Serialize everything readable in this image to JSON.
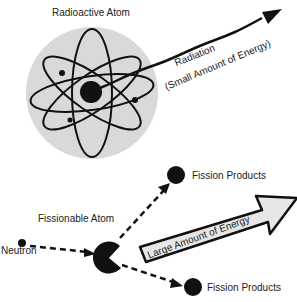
{
  "diagram": {
    "labels": {
      "radioactive_atom": "Radioactive Atom",
      "radiation": "Radiation",
      "small_energy": "(Small Amount of Energy)",
      "fissionable_atom": "Fissionable Atom",
      "neutron": "Neutron",
      "fission_products_top": "Fission Products",
      "fission_products_bottom": "Fission Products",
      "large_energy": "Large Amount of Energy"
    },
    "colors": {
      "atom_background": "#d9d9d9",
      "ink": "#111111",
      "energy_arrow_fill": "#e6e6e6"
    }
  }
}
